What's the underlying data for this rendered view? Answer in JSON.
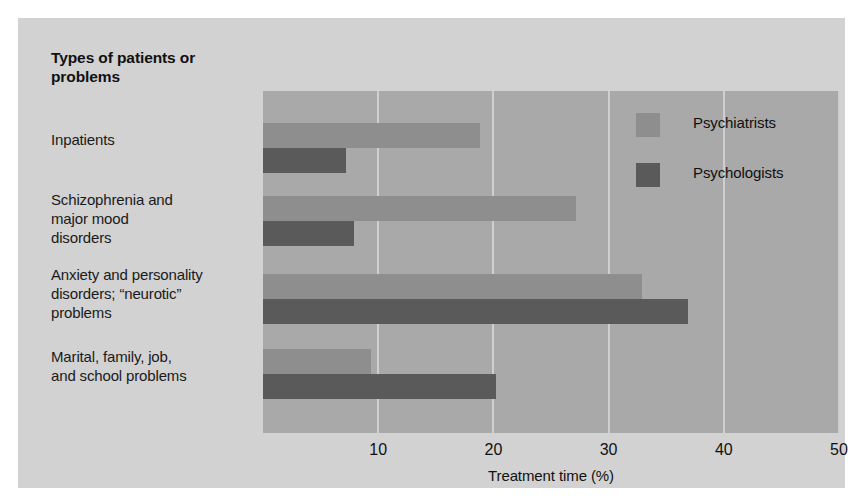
{
  "figure": {
    "background_color": "#ffffff",
    "card_color": "#d2d2d2",
    "plot_background_color": "#a9a9a9",
    "gridline_color": "#cfcfcf"
  },
  "axis_title": "Types of patients or problems",
  "legend": {
    "items": [
      {
        "label": "Psychiatrists",
        "color": "#8e8e8e",
        "swatch_name": "legend-swatch-psychiatrists"
      },
      {
        "label": "Psychologists",
        "color": "#5a5a5a",
        "swatch_name": "legend-swatch-psychologists"
      }
    ]
  },
  "chart_data": {
    "type": "bar",
    "orientation": "horizontal",
    "title": "Types of patients or problems",
    "xlabel": "Treatment time (%)",
    "ylabel": "Types of patients or problems",
    "xlim": [
      0,
      50
    ],
    "xticks": [
      10,
      20,
      30,
      40,
      50
    ],
    "xticklabels": [
      "10",
      "20",
      "30",
      "40",
      "50"
    ],
    "grid": true,
    "grid_axis": "x",
    "legend_position": "upper right (inside plot)",
    "categories": [
      "Inpatients",
      "Schizophrenia and major mood disorders",
      "Anxiety and personality disorders; “neurotic” problems",
      "Marital, family, job, and school problems"
    ],
    "category_labels_wrapped": [
      "Inpatients",
      "Schizophrenia and\nmajor mood\ndisorders",
      "Anxiety and personality\ndisorders; “neurotic”\nproblems",
      "Marital, family, job,\nand school problems"
    ],
    "series": [
      {
        "name": "Psychiatrists",
        "color": "#8e8e8e",
        "values": [
          18.8,
          27.2,
          32.9,
          9.4
        ]
      },
      {
        "name": "Psychologists",
        "color": "#5a5a5a",
        "values": [
          7.2,
          7.9,
          36.9,
          20.2
        ]
      }
    ]
  }
}
